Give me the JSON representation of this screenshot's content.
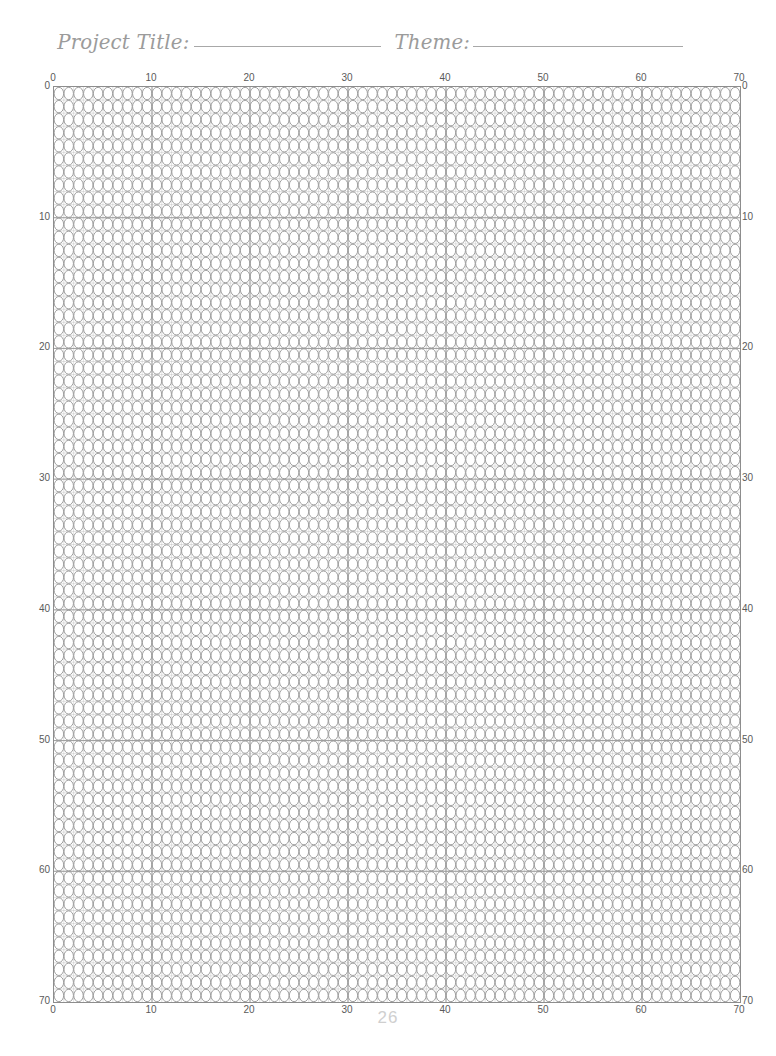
{
  "page": {
    "number": "26",
    "width": 776,
    "height": 1056,
    "background_color": "#ffffff"
  },
  "header": {
    "fields": [
      {
        "label": "Project Title:",
        "value": "",
        "rule_width": 187
      },
      {
        "label": "Theme:",
        "value": "",
        "rule_width": 210
      }
    ],
    "label_color": "#9b9b9b",
    "rule_color": "#a8a8a8"
  },
  "grid": {
    "kind": "bead-graph-paper",
    "bead_shape": "ellipse",
    "columns": 70,
    "rows": 70,
    "cell_width": 9.8,
    "cell_height": 13.07,
    "major_interval": 10,
    "bead_stroke_color": "#8d8d8d",
    "major_line_color": "#9a9a9a",
    "frame_color": "#8d8d8d",
    "left_px": 53,
    "top_px": 86,
    "width_px": 686,
    "height_px": 915
  },
  "axes": {
    "tick_color": "#5a5a5a",
    "top": {
      "label": "",
      "ticks": [
        "0",
        "10",
        "20",
        "30",
        "40",
        "50",
        "60",
        "70"
      ],
      "values": [
        0,
        10,
        20,
        30,
        40,
        50,
        60,
        70
      ]
    },
    "bottom": {
      "label": "",
      "ticks": [
        "0",
        "10",
        "20",
        "30",
        "40",
        "50",
        "60",
        "70"
      ],
      "values": [
        0,
        10,
        20,
        30,
        40,
        50,
        60,
        70
      ]
    },
    "left": {
      "label": "",
      "ticks": [
        "0",
        "10",
        "20",
        "30",
        "40",
        "50",
        "60",
        "70"
      ],
      "values": [
        0,
        10,
        20,
        30,
        40,
        50,
        60,
        70
      ]
    },
    "right": {
      "label": "",
      "ticks": [
        "0",
        "10",
        "20",
        "30",
        "40",
        "50",
        "60",
        "70"
      ],
      "values": [
        0,
        10,
        20,
        30,
        40,
        50,
        60,
        70
      ]
    }
  },
  "chart_data": {
    "type": "table",
    "title": "",
    "xlabel": "",
    "ylabel": "",
    "xlim": [
      0,
      70
    ],
    "ylim": [
      0,
      70
    ],
    "grid": true,
    "categories": [],
    "values": []
  }
}
